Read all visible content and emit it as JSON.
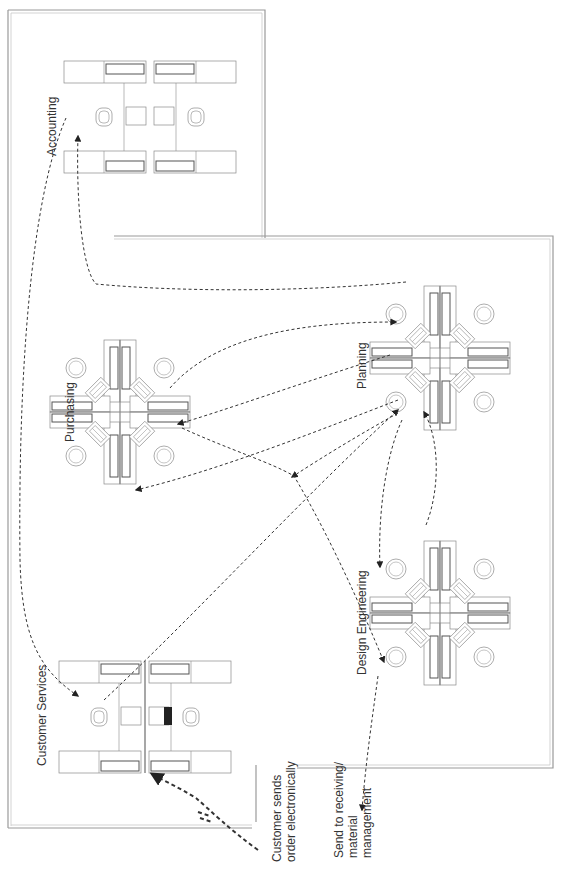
{
  "diagram": {
    "type": "office-workflow-floor-plan",
    "departments": [
      {
        "id": "accounting",
        "label": "Accounting"
      },
      {
        "id": "purchasing",
        "label": "Purchasing"
      },
      {
        "id": "planning",
        "label": "Planning"
      },
      {
        "id": "design_engineering",
        "label": "Design Engineering"
      },
      {
        "id": "customer_services",
        "label": "Customer Services"
      }
    ],
    "annotations": {
      "customer_input": [
        "Customer sends",
        "order electronically"
      ],
      "output": [
        "Send to receiving/",
        "material",
        "management"
      ]
    },
    "flows": [
      {
        "from": "customer",
        "to": "customer_services"
      },
      {
        "from": "accounting",
        "to": "customer_services"
      },
      {
        "from": "planning",
        "to": "accounting"
      },
      {
        "from": "purchasing",
        "to": "planning"
      },
      {
        "from": "planning",
        "to": "purchasing"
      },
      {
        "from": "customer_services",
        "to": "planning"
      },
      {
        "from": "planning",
        "to": "purchasing"
      },
      {
        "from": "purchasing",
        "to": "design_engineering"
      },
      {
        "from": "planning",
        "to": "design_engineering"
      },
      {
        "from": "design_engineering",
        "to": "planning"
      },
      {
        "from": "design_engineering",
        "to": "receiving"
      }
    ],
    "colors": {
      "wall": "#9a9a9a",
      "furniture": "#8a8a8a",
      "flow": "#333333",
      "text": "#333333"
    }
  }
}
